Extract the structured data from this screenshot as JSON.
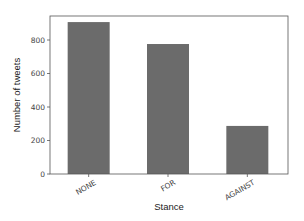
{
  "chart_data": {
    "type": "bar",
    "title": "",
    "xlabel": "Stance",
    "ylabel": "Number of tweets",
    "categories": [
      "NONE",
      "FOR",
      "AGAINST"
    ],
    "values": [
      907,
      776,
      287
    ],
    "ylim": [
      0,
      950
    ],
    "yticks": [
      0,
      200,
      400,
      600,
      800
    ],
    "grid": false,
    "legend": null,
    "bar_color": "#6b6b6b",
    "xtick_rotation": 30
  }
}
